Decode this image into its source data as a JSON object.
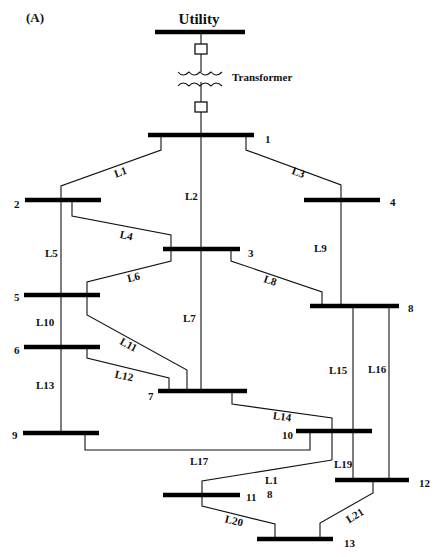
{
  "panel_label": "(A)",
  "title": "Utility",
  "transformer_label": "Transformer",
  "buses": [
    {
      "id": "1",
      "label": "1"
    },
    {
      "id": "2",
      "label": "2"
    },
    {
      "id": "3",
      "label": "3"
    },
    {
      "id": "4",
      "label": "4"
    },
    {
      "id": "5",
      "label": "5"
    },
    {
      "id": "6",
      "label": "6"
    },
    {
      "id": "7",
      "label": "7"
    },
    {
      "id": "8",
      "label": "8"
    },
    {
      "id": "9",
      "label": "9"
    },
    {
      "id": "10",
      "label": "10"
    },
    {
      "id": "11",
      "label": "11"
    },
    {
      "id": "12",
      "label": "12"
    },
    {
      "id": "13",
      "label": "13"
    }
  ],
  "lines": [
    {
      "id": "L1",
      "label": "L1",
      "from": "1",
      "to": "2"
    },
    {
      "id": "L2",
      "label": "L2",
      "from": "1",
      "to": "7"
    },
    {
      "id": "L3",
      "label": "L3",
      "from": "1",
      "to": "4"
    },
    {
      "id": "L4",
      "label": "L4",
      "from": "2",
      "to": "3"
    },
    {
      "id": "L5",
      "label": "L5",
      "from": "2",
      "to": "5"
    },
    {
      "id": "L6",
      "label": "L6",
      "from": "3",
      "to": "5"
    },
    {
      "id": "L7",
      "label": "L7",
      "from": "3",
      "to": "7"
    },
    {
      "id": "L8",
      "label": "L8",
      "from": "3",
      "to": "8"
    },
    {
      "id": "L9",
      "label": "L9",
      "from": "4",
      "to": "8"
    },
    {
      "id": "L10",
      "label": "L10",
      "from": "5",
      "to": "6"
    },
    {
      "id": "L11",
      "label": "L11",
      "from": "5",
      "to": "7"
    },
    {
      "id": "L12",
      "label": "L12",
      "from": "6",
      "to": "7"
    },
    {
      "id": "L13",
      "label": "L13",
      "from": "6",
      "to": "9"
    },
    {
      "id": "L14",
      "label": "L14",
      "from": "7",
      "to": "10"
    },
    {
      "id": "L15",
      "label": "L15",
      "from": "8",
      "to": "12"
    },
    {
      "id": "L16",
      "label": "L16",
      "from": "8",
      "to": "12"
    },
    {
      "id": "L17",
      "label": "L17",
      "from": "9",
      "to": "10"
    },
    {
      "id": "L18",
      "label_line1": "L1",
      "label_line2": "8",
      "from": "10",
      "to": "11"
    },
    {
      "id": "L19",
      "label": "L19",
      "from": "10",
      "to": "12"
    },
    {
      "id": "L20",
      "label": "L20",
      "from": "11",
      "to": "13"
    },
    {
      "id": "L21",
      "label": "L21",
      "from": "12",
      "to": "13"
    }
  ]
}
